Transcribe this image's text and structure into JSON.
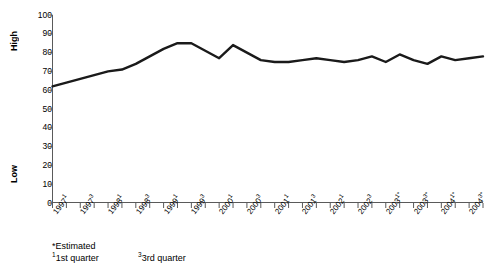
{
  "chart_data": {
    "type": "line",
    "title": "",
    "subtitle": "",
    "xlabel": "",
    "ylabel": "",
    "ylim": [
      0,
      100
    ],
    "ytick_values": [
      0,
      10,
      20,
      30,
      40,
      50,
      60,
      70,
      80,
      90,
      100
    ],
    "y_axis_high_label": "High",
    "y_axis_low_label": "Low",
    "grid": false,
    "legend": "none",
    "categories": [
      "1997¹",
      "1997²",
      "1997³",
      "1997⁴",
      "1998¹",
      "1998²",
      "1998³",
      "1998⁴",
      "1999¹",
      "1999²",
      "1999³",
      "1999⁴",
      "2000¹",
      "2000²",
      "2000³",
      "2000⁴",
      "2001¹",
      "2001²",
      "2001³",
      "2001⁴",
      "2002¹",
      "2002²",
      "2002³",
      "2002⁴",
      "2003¹*",
      "2003²*",
      "2003³*",
      "2003⁴*",
      "2004¹*",
      "2004²*",
      "2004³*",
      "2004⁴*"
    ],
    "values": [
      62,
      64,
      66,
      68,
      70,
      71,
      74,
      78,
      82,
      85,
      85,
      81,
      77,
      84,
      80,
      76,
      75,
      75,
      76,
      77,
      76,
      75,
      76,
      78,
      75,
      79,
      76,
      74,
      78,
      76,
      77,
      78
    ],
    "series": [
      {
        "name": "Index",
        "color": "#1a1a1a",
        "values": [
          62,
          64,
          66,
          68,
          70,
          71,
          74,
          78,
          82,
          85,
          85,
          81,
          77,
          84,
          80,
          76,
          75,
          75,
          76,
          77,
          76,
          75,
          76,
          78,
          75,
          79,
          76,
          74,
          78,
          76,
          77,
          78
        ]
      }
    ],
    "x_tick_labels_shown": [
      {
        "label": "1997",
        "sup": "1"
      },
      {
        "label": "1997",
        "sup": "3"
      },
      {
        "label": "1998",
        "sup": "1"
      },
      {
        "label": "1998",
        "sup": "3"
      },
      {
        "label": "1999",
        "sup": "1"
      },
      {
        "label": "1999",
        "sup": "3"
      },
      {
        "label": "2000",
        "sup": "1"
      },
      {
        "label": "2000",
        "sup": "3"
      },
      {
        "label": "2001",
        "sup": "1"
      },
      {
        "label": "2001",
        "sup": "3"
      },
      {
        "label": "2002",
        "sup": "1"
      },
      {
        "label": "2002",
        "sup": "3"
      },
      {
        "label": "2003",
        "sup": "1*"
      },
      {
        "label": "2003",
        "sup": "3*"
      },
      {
        "label": "2004",
        "sup": "1*"
      },
      {
        "label": "2004",
        "sup": "3*"
      }
    ]
  },
  "footnotes": {
    "estimated": "*Estimated",
    "q1_marker": "1",
    "q1_text": "1st quarter",
    "q3_marker": "3",
    "q3_text": "3rd quarter"
  },
  "colors": {
    "line": "#1a1a1a",
    "axis": "#5a5a5a",
    "text": "#000000",
    "background": "#ffffff"
  }
}
